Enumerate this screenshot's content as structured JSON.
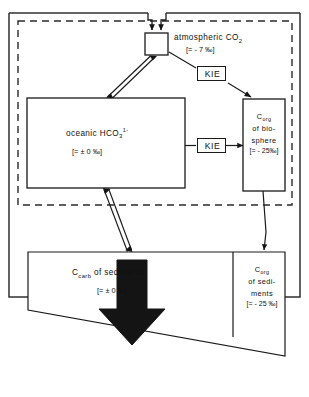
{
  "diagram": {
    "type": "box-and-arrow flow diagram",
    "line_color": "#1a1a1a",
    "fill_color": "#ffffff",
    "arrow_fill": "#141414"
  },
  "boxes": {
    "atmosphere": {
      "name": "atmospheric-co2",
      "label": "atmospheric CO",
      "label_sub": "2",
      "value": "[= - 7 ‰]"
    },
    "ocean": {
      "name": "oceanic-bicarbonate",
      "label": "oceanic  HCO",
      "label_sub": "3",
      "label_sup": "1-",
      "value": "[= ± 0 ‰]"
    },
    "biosphere": {
      "name": "c-org-biosphere",
      "line1": "C",
      "line1_sub": "org",
      "line2": "of bio-",
      "line3": "sphere",
      "value": "[= - 25‰]"
    },
    "carb_sediments": {
      "name": "c-carb-sediments",
      "label": "C",
      "label_sub": "carb",
      "label_rest": " of sediments",
      "value": "[= ± 0 ‰]"
    },
    "org_sediments": {
      "name": "c-org-sediments",
      "line1": "C",
      "line1_sub": "org",
      "line2": "of sedi-",
      "line3": "ments",
      "value": "[= - 25 ‰]"
    }
  },
  "annotations": {
    "kie_atmosphere_biosphere": "KIE",
    "kie_ocean_biosphere": "KIE"
  }
}
